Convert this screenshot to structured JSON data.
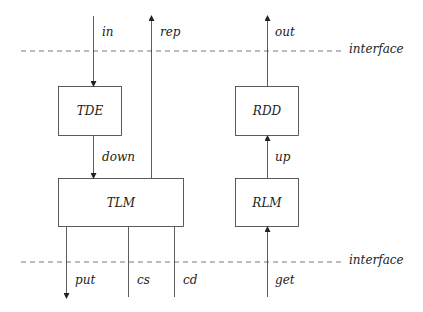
{
  "diagram": {
    "interface_top": {
      "label": "interface"
    },
    "interface_bottom": {
      "label": "interface"
    },
    "boxes": {
      "tde": "TDE",
      "tlm": "TLM",
      "rdd": "RDD",
      "rlm": "RLM"
    },
    "arrows": {
      "in": "in",
      "rep": "rep",
      "down": "down",
      "put": "put",
      "cs": "cs",
      "cd": "cd",
      "out": "out",
      "up": "up",
      "get": "get"
    }
  }
}
